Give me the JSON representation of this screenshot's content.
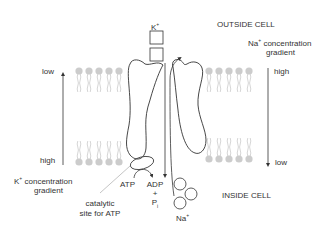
{
  "labels": {
    "k_ion": "K",
    "k_ion_sup": "+",
    "outside_cell": "OUTSIDE CELL",
    "inside_cell": "INSIDE CELL",
    "na_gradient_line1": "Na",
    "na_gradient_sup": "+",
    "na_gradient_rest": " concentration",
    "na_gradient_line2": "gradient",
    "na_high": "high",
    "na_low": "low",
    "k_low": "low",
    "k_high": "high",
    "k_gradient_line1": "K",
    "k_gradient_sup": "+",
    "k_gradient_rest": " concentration",
    "k_gradient_line2": "gradient",
    "atp": "ATP",
    "adp": "ADP",
    "plus": "+",
    "pi": "P",
    "pi_sub": "i",
    "catalytic_line1": "catalytic",
    "catalytic_line2": "site for ATP",
    "na_ion": "Na",
    "na_ion_sup": "+"
  },
  "colors": {
    "stroke": "#333333",
    "lipid": "#c8c8c8",
    "text": "#333333"
  }
}
